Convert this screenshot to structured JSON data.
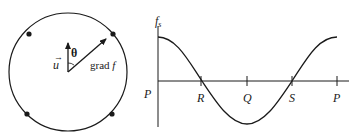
{
  "left_diagram": {
    "vector_u_label": "u",
    "angle_label": "θ",
    "gradient_label_prefix": "grad ",
    "gradient_label_var": "f",
    "points_on_circle": 4
  },
  "right_plot": {
    "y_axis_label_main": "f",
    "y_axis_label_sub": "s",
    "x_tick_labels": [
      "P",
      "R",
      "Q",
      "S",
      "P"
    ],
    "curve": "cosine, one full period from P back to P"
  },
  "colors": {
    "ink": "#1a1a1a",
    "background": "#ffffff"
  }
}
